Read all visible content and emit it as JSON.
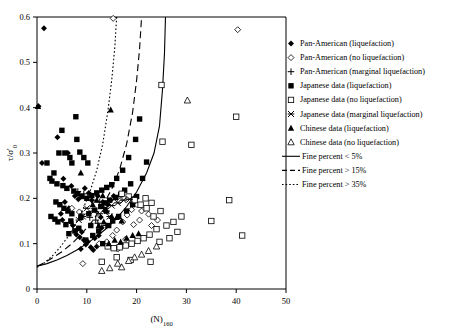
{
  "figure": {
    "background": "#ffffff",
    "frame_color": "#000000"
  },
  "axes": {
    "x": {
      "label": "(N)",
      "label_sub": "160",
      "min": 0,
      "max": 50,
      "ticks": [
        0,
        10,
        20,
        30,
        40,
        50
      ],
      "tick_labels": [
        "0",
        "10",
        "20",
        "30",
        "40",
        "50"
      ]
    },
    "y": {
      "label": "τ/σ'",
      "label_sub": "0",
      "min": 0,
      "max": 0.6,
      "ticks": [
        0,
        0.1,
        0.2,
        0.3,
        0.4,
        0.5,
        0.6
      ],
      "tick_labels": [
        "0",
        "0.1",
        "0.2",
        "0.3",
        "0.4",
        "0.5",
        "0.6"
      ]
    }
  },
  "legend": {
    "items": [
      {
        "marker": "filled-diamond-marker",
        "label": "Pan-American (liquefaction)"
      },
      {
        "marker": "open-diamond-marker",
        "label": "Pan-American (no liquefaction)"
      },
      {
        "marker": "plus-marker",
        "label": "Pan-American  (marginal liquefaction)"
      },
      {
        "marker": "filled-square-marker",
        "label": "Japanese data (liquefaction)"
      },
      {
        "marker": "open-square-marker",
        "label": "Japanese data (no liquefaction)"
      },
      {
        "marker": "star-marker",
        "label": "Japanese data   (marginal liquefaction)"
      },
      {
        "marker": "filled-triangle-marker",
        "label": "Chinese data (liquefaction)"
      },
      {
        "marker": "open-triangle-marker",
        "label": "Chinese data (no liquefaction)"
      },
      {
        "marker": "solid-line",
        "label": "Fine percent < 5%"
      },
      {
        "marker": "dashed-line",
        "label": "Fine percent > 15%"
      },
      {
        "marker": "dotted-line",
        "label": "Fine percent  > 35%"
      }
    ]
  },
  "chart_data": {
    "type": "scatter",
    "title": "",
    "xlabel": "(N)160",
    "ylabel": "τ/σ'0",
    "xlim": [
      0,
      50
    ],
    "ylim": [
      0,
      0.6
    ],
    "grid": false,
    "legend_position": "right-outside",
    "series": [
      {
        "name": "Pan-American (liquefaction)",
        "marker": "filled-diamond",
        "points": [
          [
            1.4,
            0.575
          ],
          [
            0.3,
            0.403
          ],
          [
            4.1,
            0.335
          ],
          [
            1.0,
            0.278
          ],
          [
            6.2,
            0.3
          ],
          [
            5.3,
            0.243
          ],
          [
            6.9,
            0.227
          ],
          [
            7.6,
            0.205
          ],
          [
            8.3,
            0.198
          ],
          [
            5.6,
            0.192
          ],
          [
            6.4,
            0.178
          ],
          [
            4.8,
            0.166
          ],
          [
            5.1,
            0.152
          ],
          [
            6.8,
            0.148
          ],
          [
            7.2,
            0.14
          ],
          [
            8.1,
            0.132
          ],
          [
            9.0,
            0.126
          ],
          [
            7.9,
            0.12
          ],
          [
            8.6,
            0.114
          ],
          [
            9.4,
            0.108
          ],
          [
            10.2,
            0.104
          ],
          [
            9.8,
            0.098
          ],
          [
            10.8,
            0.092
          ],
          [
            8.8,
            0.088
          ],
          [
            11.3,
            0.086
          ],
          [
            12.0,
            0.094
          ],
          [
            11.6,
            0.112
          ],
          [
            12.4,
            0.118
          ],
          [
            13.0,
            0.135
          ],
          [
            12.8,
            0.158
          ],
          [
            13.6,
            0.172
          ],
          [
            14.2,
            0.186
          ],
          [
            11.0,
            0.196
          ],
          [
            10.4,
            0.212
          ],
          [
            9.6,
            0.222
          ],
          [
            12.2,
            0.205
          ],
          [
            14.8,
            0.196
          ],
          [
            15.4,
            0.205
          ],
          [
            13.2,
            0.192
          ]
        ]
      },
      {
        "name": "Pan-American (no liquefaction)",
        "marker": "open-diamond",
        "points": [
          [
            15.3,
            0.597
          ],
          [
            40.3,
            0.572
          ],
          [
            7.0,
            0.178
          ],
          [
            8.5,
            0.17
          ],
          [
            9.2,
            0.056
          ],
          [
            12.5,
            0.1
          ],
          [
            14.0,
            0.104
          ],
          [
            15.2,
            0.118
          ],
          [
            16.0,
            0.13
          ],
          [
            17.2,
            0.148
          ],
          [
            18.1,
            0.163
          ],
          [
            19.0,
            0.175
          ],
          [
            20.1,
            0.186
          ],
          [
            16.6,
            0.194
          ],
          [
            21.0,
            0.172
          ],
          [
            22.4,
            0.165
          ],
          [
            20.6,
            0.152
          ],
          [
            19.4,
            0.142
          ],
          [
            23.0,
            0.14
          ],
          [
            24.2,
            0.152
          ],
          [
            17.8,
            0.11
          ],
          [
            16.2,
            0.088
          ]
        ]
      },
      {
        "name": "Pan-American (marginal liquefaction)",
        "marker": "plus",
        "points": [
          [
            8.2,
            0.215
          ],
          [
            9.4,
            0.21
          ],
          [
            10.2,
            0.202
          ],
          [
            11.0,
            0.196
          ],
          [
            12.6,
            0.192
          ],
          [
            13.4,
            0.18
          ],
          [
            14.0,
            0.172
          ],
          [
            9.0,
            0.165
          ],
          [
            10.6,
            0.158
          ],
          [
            11.8,
            0.152
          ],
          [
            12.2,
            0.145
          ],
          [
            13.8,
            0.14
          ]
        ]
      },
      {
        "name": "Japanese data (liquefaction)",
        "marker": "filled-square",
        "points": [
          [
            7.8,
            0.38
          ],
          [
            5.0,
            0.35
          ],
          [
            8.0,
            0.33
          ],
          [
            5.6,
            0.3
          ],
          [
            2.0,
            0.278
          ],
          [
            3.4,
            0.256
          ],
          [
            2.6,
            0.244
          ],
          [
            3.0,
            0.238
          ],
          [
            6.6,
            0.29
          ],
          [
            7.0,
            0.278
          ],
          [
            4.4,
            0.3
          ],
          [
            8.6,
            0.302
          ],
          [
            9.4,
            0.29
          ],
          [
            10.2,
            0.278
          ],
          [
            4.0,
            0.232
          ],
          [
            5.2,
            0.228
          ],
          [
            6.0,
            0.222
          ],
          [
            7.4,
            0.216
          ],
          [
            8.2,
            0.21
          ],
          [
            9.0,
            0.204
          ],
          [
            10.0,
            0.2
          ],
          [
            11.0,
            0.206
          ],
          [
            12.0,
            0.212
          ],
          [
            13.0,
            0.218
          ],
          [
            14.0,
            0.224
          ],
          [
            15.0,
            0.23
          ],
          [
            16.0,
            0.244
          ],
          [
            17.2,
            0.262
          ],
          [
            18.4,
            0.29
          ],
          [
            19.8,
            0.33
          ],
          [
            20.6,
            0.375
          ],
          [
            3.8,
            0.192
          ],
          [
            4.6,
            0.186
          ],
          [
            5.4,
            0.178
          ],
          [
            6.2,
            0.172
          ],
          [
            7.0,
            0.166
          ],
          [
            2.8,
            0.16
          ],
          [
            3.6,
            0.154
          ],
          [
            4.2,
            0.148
          ],
          [
            5.8,
            0.142
          ],
          [
            6.8,
            0.15
          ],
          [
            8.8,
            0.158
          ],
          [
            10.4,
            0.166
          ],
          [
            11.6,
            0.174
          ],
          [
            12.8,
            0.182
          ],
          [
            13.6,
            0.19
          ],
          [
            14.6,
            0.196
          ],
          [
            15.8,
            0.202
          ],
          [
            16.8,
            0.208
          ],
          [
            17.6,
            0.218
          ],
          [
            18.8,
            0.232
          ],
          [
            13.2,
            0.1
          ],
          [
            9.8,
            0.108
          ],
          [
            11.2,
            0.118
          ],
          [
            12.4,
            0.128
          ],
          [
            14.4,
            0.14
          ],
          [
            15.2,
            0.15
          ],
          [
            16.4,
            0.16
          ],
          [
            18.0,
            0.172
          ],
          [
            19.2,
            0.186
          ],
          [
            20.0,
            0.204
          ],
          [
            21.2,
            0.244
          ],
          [
            22.0,
            0.28
          ],
          [
            10.8,
            0.14
          ],
          [
            8.4,
            0.134
          ],
          [
            7.6,
            0.128
          ],
          [
            6.4,
            0.122
          ]
        ]
      },
      {
        "name": "Japanese data (no liquefaction)",
        "marker": "open-square",
        "points": [
          [
            25.0,
            0.45
          ],
          [
            25.2,
            0.325
          ],
          [
            31.0,
            0.318
          ],
          [
            40.0,
            0.38
          ],
          [
            38.6,
            0.196
          ],
          [
            35.0,
            0.15
          ],
          [
            41.2,
            0.118
          ],
          [
            27.4,
            0.148
          ],
          [
            24.0,
            0.132
          ],
          [
            22.6,
            0.12
          ],
          [
            21.4,
            0.112
          ],
          [
            20.2,
            0.106
          ],
          [
            19.0,
            0.1
          ],
          [
            17.8,
            0.096
          ],
          [
            16.6,
            0.092
          ],
          [
            15.4,
            0.09
          ],
          [
            14.2,
            0.094
          ],
          [
            23.4,
            0.16
          ],
          [
            24.8,
            0.172
          ],
          [
            22.0,
            0.178
          ],
          [
            20.8,
            0.186
          ],
          [
            19.6,
            0.196
          ],
          [
            18.4,
            0.204
          ],
          [
            17.0,
            0.21
          ],
          [
            21.8,
            0.2
          ],
          [
            23.0,
            0.19
          ],
          [
            26.0,
            0.14
          ],
          [
            28.2,
            0.126
          ],
          [
            24.6,
            0.104
          ],
          [
            26.6,
            0.112
          ],
          [
            29.0,
            0.16
          ],
          [
            22.8,
            0.06
          ],
          [
            16.0,
            0.07
          ],
          [
            18.8,
            0.064
          ],
          [
            13.0,
            0.06
          ]
        ]
      },
      {
        "name": "Japanese data (marginal liquefaction)",
        "marker": "star",
        "points": [
          [
            10.0,
            0.178
          ],
          [
            11.4,
            0.172
          ],
          [
            12.6,
            0.166
          ],
          [
            13.8,
            0.178
          ],
          [
            15.0,
            0.184
          ],
          [
            16.2,
            0.19
          ],
          [
            17.4,
            0.196
          ],
          [
            9.2,
            0.16
          ],
          [
            8.4,
            0.152
          ],
          [
            14.6,
            0.16
          ],
          [
            18.6,
            0.198
          ]
        ]
      },
      {
        "name": "Chinese data (liquefaction)",
        "marker": "filled-triangle",
        "points": [
          [
            0.2,
            0.403
          ],
          [
            14.8,
            0.395
          ],
          [
            8.8,
            0.256
          ],
          [
            13.2,
            0.206
          ],
          [
            12.0,
            0.196
          ],
          [
            11.2,
            0.186
          ],
          [
            14.0,
            0.172
          ],
          [
            15.0,
            0.16
          ],
          [
            13.4,
            0.148
          ],
          [
            12.4,
            0.14
          ],
          [
            16.0,
            0.158
          ],
          [
            17.0,
            0.15
          ],
          [
            15.6,
            0.108
          ],
          [
            14.4,
            0.1
          ],
          [
            16.8,
            0.104
          ],
          [
            18.0,
            0.112
          ],
          [
            19.2,
            0.118
          ],
          [
            20.4,
            0.122
          ]
        ]
      },
      {
        "name": "Chinese data (no liquefaction)",
        "marker": "open-triangle",
        "points": [
          [
            30.2,
            0.416
          ],
          [
            13.0,
            0.04
          ],
          [
            16.2,
            0.056
          ],
          [
            18.4,
            0.062
          ],
          [
            21.0,
            0.076
          ],
          [
            22.4,
            0.084
          ],
          [
            24.0,
            0.094
          ],
          [
            19.6,
            0.07
          ],
          [
            17.0,
            0.048
          ],
          [
            14.6,
            0.046
          ]
        ]
      }
    ],
    "curves": [
      {
        "name": "Fine percent < 5%",
        "style": "solid",
        "points": [
          [
            0.0,
            0.05
          ],
          [
            2.0,
            0.056
          ],
          [
            4.0,
            0.064
          ],
          [
            6.0,
            0.074
          ],
          [
            8.0,
            0.086
          ],
          [
            10.0,
            0.1
          ],
          [
            12.0,
            0.116
          ],
          [
            14.0,
            0.134
          ],
          [
            16.0,
            0.156
          ],
          [
            18.0,
            0.182
          ],
          [
            20.0,
            0.214
          ],
          [
            22.0,
            0.256
          ],
          [
            23.5,
            0.3
          ],
          [
            24.6,
            0.36
          ],
          [
            25.2,
            0.44
          ],
          [
            25.6,
            0.52
          ],
          [
            25.8,
            0.6
          ]
        ]
      },
      {
        "name": "Fine percent > 15%",
        "style": "dashed",
        "points": [
          [
            0.0,
            0.05
          ],
          [
            1.5,
            0.058
          ],
          [
            3.0,
            0.068
          ],
          [
            5.0,
            0.082
          ],
          [
            7.0,
            0.1
          ],
          [
            9.0,
            0.122
          ],
          [
            11.0,
            0.148
          ],
          [
            13.0,
            0.18
          ],
          [
            15.0,
            0.22
          ],
          [
            16.6,
            0.264
          ],
          [
            18.0,
            0.32
          ],
          [
            19.2,
            0.39
          ],
          [
            20.0,
            0.46
          ],
          [
            20.6,
            0.53
          ],
          [
            21.0,
            0.6
          ]
        ]
      },
      {
        "name": "Fine percent > 35%",
        "style": "dotted",
        "points": [
          [
            0.0,
            0.048
          ],
          [
            1.5,
            0.058
          ],
          [
            3.0,
            0.072
          ],
          [
            4.5,
            0.09
          ],
          [
            6.0,
            0.112
          ],
          [
            7.5,
            0.138
          ],
          [
            9.0,
            0.17
          ],
          [
            10.5,
            0.21
          ],
          [
            12.0,
            0.262
          ],
          [
            13.2,
            0.32
          ],
          [
            14.2,
            0.39
          ],
          [
            15.0,
            0.46
          ],
          [
            15.6,
            0.53
          ],
          [
            16.0,
            0.6
          ]
        ]
      }
    ]
  }
}
